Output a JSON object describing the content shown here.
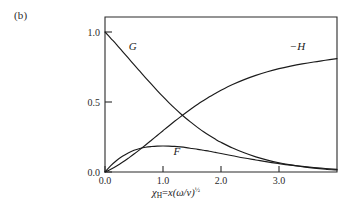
{
  "figure": {
    "panel_label": "(b)"
  },
  "axis_title": {
    "variable": "χ",
    "subscript": "H",
    "equals": "=",
    "expression": "x(ω/ν)",
    "exponent": "½"
  },
  "chart_data": {
    "type": "line",
    "title": "",
    "subtitle": "",
    "xlabel": "χ_H = x(ω/ν)^(1/2)",
    "ylabel": "",
    "xlim": [
      0.0,
      4.0
    ],
    "ylim": [
      0.0,
      1.1
    ],
    "grid": false,
    "legend_position": "inline-annotations",
    "xticks": [
      0.0,
      1.0,
      2.0,
      3.0
    ],
    "xtick_labels": [
      "0.0",
      "1.0",
      "2.0",
      "3.0"
    ],
    "yticks": [
      0.0,
      0.5,
      1.0
    ],
    "ytick_labels": [
      "0.0",
      "0.5",
      "1.0"
    ],
    "x": [
      0.0,
      0.1,
      0.2,
      0.3,
      0.4,
      0.5,
      0.6,
      0.7,
      0.8,
      0.9,
      1.0,
      1.1,
      1.2,
      1.3,
      1.4,
      1.5,
      1.6,
      1.7,
      1.8,
      1.9,
      2.0,
      2.2,
      2.4,
      2.6,
      2.8,
      3.0,
      3.2,
      3.4,
      3.6,
      3.8,
      4.0
    ],
    "series": [
      {
        "name": "G",
        "label": "G",
        "label_x": 0.48,
        "label_y": 0.875,
        "values": [
          1.0,
          0.955,
          0.91,
          0.862,
          0.815,
          0.767,
          0.72,
          0.673,
          0.627,
          0.582,
          0.538,
          0.496,
          0.456,
          0.418,
          0.382,
          0.349,
          0.317,
          0.287,
          0.26,
          0.235,
          0.212,
          0.171,
          0.137,
          0.108,
          0.085,
          0.066,
          0.051,
          0.038,
          0.028,
          0.02,
          0.014
        ]
      },
      {
        "name": "F",
        "label": "F",
        "label_x": 1.24,
        "label_y": 0.122,
        "values": [
          0.0,
          0.045,
          0.082,
          0.112,
          0.136,
          0.155,
          0.168,
          0.177,
          0.182,
          0.185,
          0.186,
          0.185,
          0.183,
          0.179,
          0.174,
          0.168,
          0.162,
          0.155,
          0.148,
          0.14,
          0.132,
          0.116,
          0.1,
          0.086,
          0.072,
          0.06,
          0.049,
          0.04,
          0.032,
          0.025,
          0.019
        ]
      },
      {
        "name": "-H",
        "label": "−H",
        "label_x": 3.32,
        "label_y": 0.875,
        "values": [
          0.0,
          0.02,
          0.043,
          0.069,
          0.098,
          0.128,
          0.16,
          0.193,
          0.227,
          0.261,
          0.295,
          0.329,
          0.362,
          0.394,
          0.425,
          0.455,
          0.484,
          0.511,
          0.537,
          0.561,
          0.584,
          0.625,
          0.66,
          0.69,
          0.716,
          0.738,
          0.756,
          0.772,
          0.786,
          0.798,
          0.81
        ]
      }
    ]
  }
}
